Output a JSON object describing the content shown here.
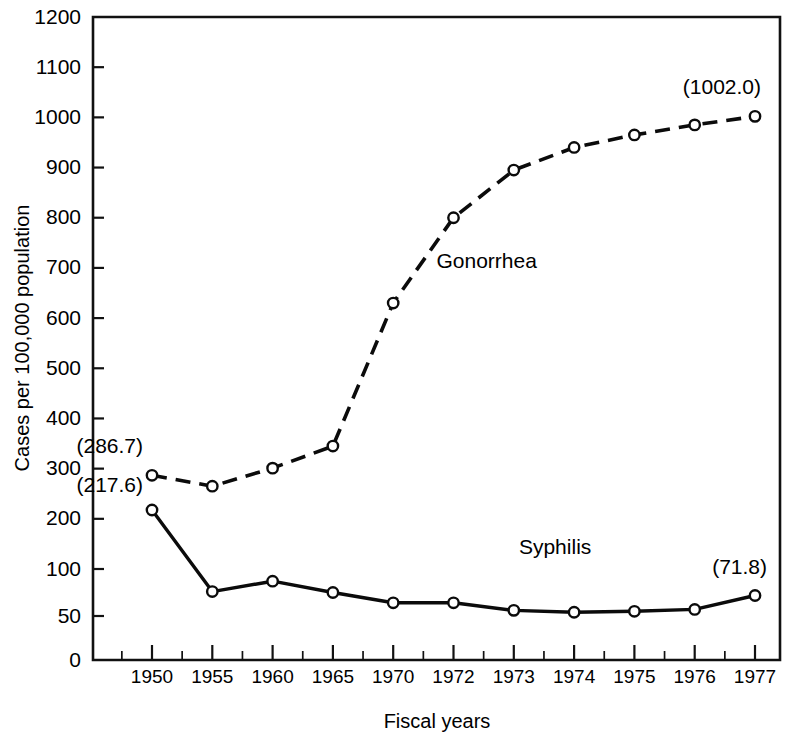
{
  "chart_data": {
    "type": "line",
    "title": "",
    "xlabel": "Fiscal years",
    "ylabel": "Cases per 100,000 population",
    "categories": [
      "1950",
      "1955",
      "1960",
      "1965",
      "1970",
      "1972",
      "1973",
      "1974",
      "1975",
      "1976",
      "1977"
    ],
    "ytick_labels": [
      "0",
      "50",
      "100",
      "200",
      "300",
      "400",
      "500",
      "600",
      "700",
      "800",
      "900",
      "1000",
      "1100",
      "1200"
    ],
    "ytick_values": [
      0,
      50,
      100,
      200,
      300,
      400,
      500,
      600,
      700,
      800,
      900,
      1000,
      1100,
      1200
    ],
    "ylim": [
      0,
      1200
    ],
    "y_scale_note": "Non-uniform: 0-50-100 at half-interval spacing, 100 to 1200 linear",
    "grid": false,
    "legend_position": "inline-labels",
    "minor_ticks_between_majors": 1,
    "series": [
      {
        "name": "Gonorrhea",
        "style": "dashed",
        "marker": "open-circle",
        "values": [
          286.7,
          265,
          301,
          345,
          630,
          800,
          895,
          940,
          965,
          985,
          1002.0
        ],
        "label_x_frac": 0.5,
        "label_y_value": 700
      },
      {
        "name": "Syphilis",
        "style": "solid",
        "marker": "open-circle",
        "values": [
          217.6,
          76,
          87,
          75,
          64,
          64,
          56,
          54,
          55,
          57,
          71.8
        ],
        "label_x_frac": 0.62,
        "label_y_value": 130
      }
    ],
    "annotations": [
      {
        "text": "(286.7)",
        "series": "Gonorrhea",
        "point_index": 0,
        "dx": -9,
        "dy": -22,
        "anchor": "end"
      },
      {
        "text": "(1002.0)",
        "series": "Gonorrhea",
        "point_index": 10,
        "dx": 6,
        "dy": -22,
        "anchor": "end"
      },
      {
        "text": "(217.6)",
        "series": "Syphilis",
        "point_index": 0,
        "dx": -9,
        "dy": -18,
        "anchor": "end"
      },
      {
        "text": "(71.8)",
        "series": "Syphilis",
        "point_index": 10,
        "dx": 12,
        "dy": -22,
        "anchor": "end"
      }
    ]
  }
}
